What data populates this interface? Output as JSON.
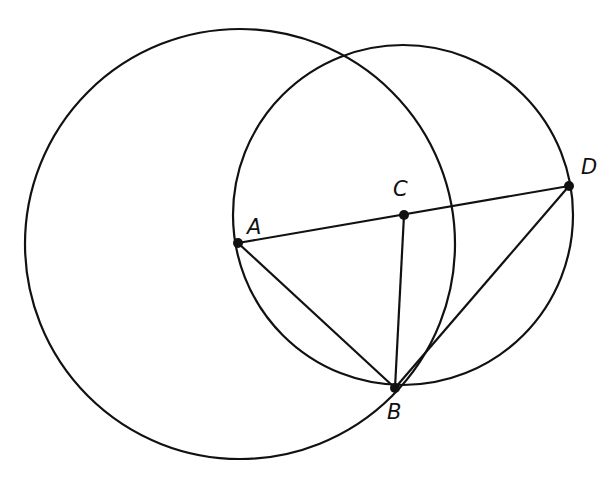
{
  "figure": {
    "width": 614,
    "height": 479,
    "stroke_color": "#111111",
    "background": "#ffffff"
  },
  "points": {
    "A": {
      "label": "A",
      "x": 238,
      "y": 243,
      "label_x": 247,
      "label_y": 234
    },
    "B": {
      "label": "B",
      "x": 395,
      "y": 388,
      "label_x": 387,
      "label_y": 419
    },
    "C": {
      "label": "C",
      "x": 404,
      "y": 215,
      "label_x": 393,
      "label_y": 196
    },
    "D": {
      "label": "D",
      "x": 569,
      "y": 186,
      "label_x": 581,
      "label_y": 174
    }
  },
  "circles": [
    {
      "name": "circle-centered-A",
      "cx": 240,
      "cy": 244,
      "r": 215
    },
    {
      "name": "circle-centered-C",
      "cx": 403,
      "cy": 215,
      "r": 170
    }
  ],
  "segments": [
    {
      "name": "segment-AD",
      "from": "A",
      "to": "D"
    },
    {
      "name": "segment-AB",
      "from": "A",
      "to": "B"
    },
    {
      "name": "segment-CB",
      "from": "C",
      "to": "B"
    },
    {
      "name": "segment-DB",
      "from": "D",
      "to": "B"
    }
  ]
}
